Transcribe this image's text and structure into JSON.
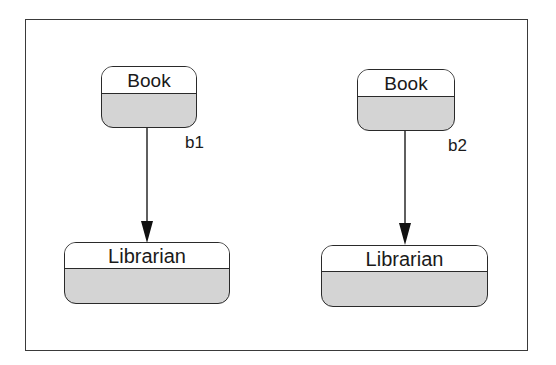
{
  "diagram": {
    "type": "object-diagram",
    "left": {
      "source": {
        "class_name": "Book"
      },
      "link_label": "b1",
      "target": {
        "class_name": "Librarian"
      }
    },
    "right": {
      "source": {
        "class_name": "Book"
      },
      "link_label": "b2",
      "target": {
        "class_name": "Librarian"
      }
    }
  },
  "colors": {
    "line": "#2a2a2a",
    "compartment_fill": "#d4d4d4",
    "header_fill": "#ffffff"
  }
}
